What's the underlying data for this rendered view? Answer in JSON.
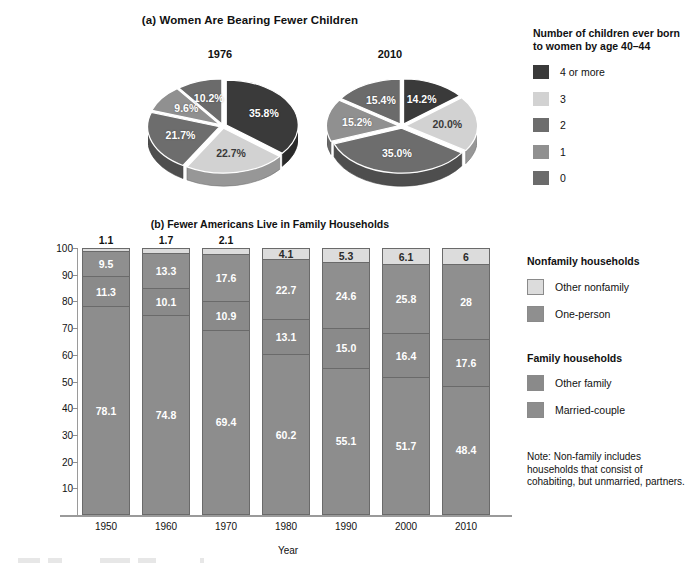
{
  "panel_a": {
    "title": "(a) Women Are Bearing Fewer Children",
    "pies": [
      {
        "year": "1976",
        "slices": [
          {
            "label": "4 or more",
            "value": 35.8,
            "display": "35.8%",
            "color": "#3a3a3a"
          },
          {
            "label": "3",
            "value": 22.7,
            "display": "22.7%",
            "color": "#d2d2d2"
          },
          {
            "label": "2",
            "value": 21.7,
            "display": "21.7%",
            "color": "#6d6d6d"
          },
          {
            "label": "1",
            "value": 9.6,
            "display": "9.6%",
            "color": "#909090"
          },
          {
            "label": "0",
            "value": 10.2,
            "display": "10.2%",
            "color": "#6b6b6b"
          }
        ]
      },
      {
        "year": "2010",
        "slices": [
          {
            "label": "4 or more",
            "value": 14.2,
            "display": "14.2%",
            "color": "#3a3a3a"
          },
          {
            "label": "3",
            "value": 20.0,
            "display": "20.0%",
            "color": "#d2d2d2"
          },
          {
            "label": "2",
            "value": 35.0,
            "display": "35.0%",
            "color": "#6d6d6d"
          },
          {
            "label": "1",
            "value": 15.2,
            "display": "15.2%",
            "color": "#909090"
          },
          {
            "label": "0",
            "value": 15.4,
            "display": "15.4%",
            "color": "#6b6b6b"
          }
        ]
      }
    ],
    "legend": {
      "title": "Number of children ever born to women by age 40–44",
      "items": [
        {
          "label": "4 or more",
          "color": "#3a3a3a"
        },
        {
          "label": "3",
          "color": "#d2d2d2"
        },
        {
          "label": "2",
          "color": "#6d6d6d"
        },
        {
          "label": "1",
          "color": "#909090"
        },
        {
          "label": "0",
          "color": "#6b6b6b"
        }
      ]
    }
  },
  "panel_b": {
    "title": "(b) Fewer Americans Live in Family Households",
    "xlabel": "Year",
    "ylabel": "Percentage of households",
    "yticks": [
      "100",
      "90",
      "80",
      "70",
      "60",
      "50",
      "40",
      "30",
      "20",
      "10"
    ],
    "legend": {
      "group1_title": "Nonfamily households",
      "group1_items": [
        {
          "label": "Other nonfamily",
          "color": "#dcdcdc"
        },
        {
          "label": "One-person",
          "color": "#8f8f8f"
        }
      ],
      "group2_title": "Family households",
      "group2_items": [
        {
          "label": "Other family",
          "color": "#8a8a8a"
        },
        {
          "label": "Married-couple",
          "color": "#8d8d8d"
        }
      ],
      "note": "Note: Non-family includes households that consist of cohabiting, but unmarried, partners."
    }
  },
  "chart_data": [
    {
      "type": "pie",
      "title": "1976",
      "labels": [
        "4 or more",
        "3",
        "2",
        "1",
        "0"
      ],
      "values": [
        35.8,
        22.7,
        21.7,
        9.6,
        10.2
      ],
      "data_labels": [
        "35.8%",
        "22.7%",
        "21.7%",
        "9.6%",
        "10.2%"
      ],
      "legend_title": "Number of children ever born to women by age 40–44",
      "legend_position": "right"
    },
    {
      "type": "pie",
      "title": "2010",
      "labels": [
        "4 or more",
        "3",
        "2",
        "1",
        "0"
      ],
      "values": [
        14.2,
        20.0,
        35.0,
        15.2,
        15.4
      ],
      "data_labels": [
        "14.2%",
        "20.0%",
        "35.0%",
        "15.2%",
        "15.4%"
      ],
      "legend_title": "Number of children ever born to women by age 40–44",
      "legend_position": "right"
    },
    {
      "type": "bar",
      "subtype": "stacked",
      "title": "(b) Fewer Americans Live in Family Households",
      "xlabel": "Year",
      "ylabel": "Percentage of households",
      "ylim": [
        0,
        100
      ],
      "grid": false,
      "legend_position": "right",
      "categories": [
        "1950",
        "1960",
        "1970",
        "1980",
        "1990",
        "2000",
        "2010"
      ],
      "series": [
        {
          "name": "Married-couple",
          "color": "#8d8d8d",
          "values": [
            78.1,
            74.8,
            69.4,
            60.2,
            55.1,
            51.7,
            48.4
          ],
          "labels": [
            "78.1",
            "74.8",
            "69.4",
            "60.2",
            "55.1",
            "51.7",
            "48.4"
          ]
        },
        {
          "name": "Other family",
          "color": "#8a8a8a",
          "values": [
            11.3,
            10.1,
            10.9,
            13.1,
            15.0,
            16.4,
            17.6
          ],
          "labels": [
            "11.3",
            "10.1",
            "10.9",
            "13.1",
            "15.0",
            "16.4",
            "17.6"
          ]
        },
        {
          "name": "One-person",
          "color": "#8f8f8f",
          "values": [
            9.5,
            13.3,
            17.6,
            22.7,
            24.6,
            25.8,
            28
          ],
          "labels": [
            "9.5",
            "13.3",
            "17.6",
            "22.7",
            "24.6",
            "25.8",
            "28"
          ]
        },
        {
          "name": "Other nonfamily",
          "color": "#dcdcdc",
          "values": [
            1.1,
            1.7,
            2.1,
            4.1,
            5.3,
            6.1,
            6
          ],
          "labels": [
            "1.1",
            "1.7",
            "2.1",
            "4.1",
            "5.3",
            "6.1",
            "6"
          ]
        }
      ]
    }
  ]
}
